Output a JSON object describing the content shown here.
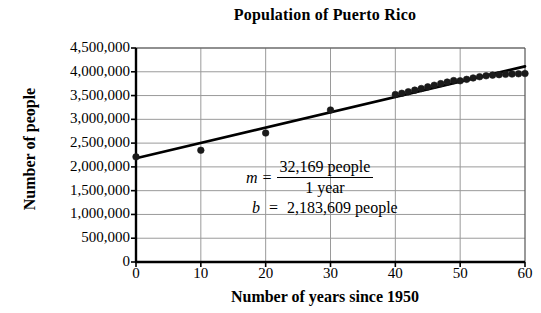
{
  "chart_data": {
    "type": "scatter",
    "title": "Population of Puerto Rico",
    "xlabel": "Number of years since 1950",
    "ylabel": "Number of people",
    "xlim": [
      0,
      60
    ],
    "ylim": [
      0,
      4500000
    ],
    "xticks": [
      0,
      10,
      20,
      30,
      40,
      50,
      60
    ],
    "xtick_labels": [
      "0",
      "10",
      "20",
      "30",
      "40",
      "50",
      "60"
    ],
    "yticks": [
      0,
      500000,
      1000000,
      1500000,
      2000000,
      2500000,
      3000000,
      3500000,
      4000000,
      4500000
    ],
    "ytick_labels": [
      "0",
      "500,000",
      "1,000,000",
      "1,500,000",
      "2,000,000",
      "2,500,000",
      "3,000,000",
      "3,500,000",
      "4,000,000",
      "4,500,000"
    ],
    "grid": true,
    "grid_color": "#9a9a9a",
    "legend": null,
    "marker_color": "#1a1a1a",
    "line_color": "#000000",
    "series": [
      {
        "name": "Population data points",
        "kind": "scatter",
        "x": [
          0,
          10,
          20,
          30,
          40,
          41,
          42,
          43,
          44,
          45,
          46,
          47,
          48,
          49,
          50,
          51,
          52,
          53,
          54,
          55,
          56,
          57,
          58,
          59,
          60
        ],
        "y": [
          2210703,
          2349544,
          2712033,
          3196520,
          3522037,
          3547968,
          3580258,
          3613710,
          3647805,
          3682512,
          3717252,
          3750650,
          3783152,
          3814428,
          3810605,
          3840360,
          3870085,
          3895885,
          3915798,
          3929552,
          3938909,
          3946779,
          3952149,
          3957988,
          3962756
        ]
      },
      {
        "name": "Line of best fit",
        "kind": "line",
        "x": [
          0,
          60
        ],
        "y": [
          2183609,
          4113749
        ]
      }
    ],
    "annotations": [
      {
        "id": "slope",
        "variable": "m",
        "equals": "=",
        "numerator": "32,169 people",
        "denominator": "1 year",
        "form": "fraction"
      },
      {
        "id": "intercept",
        "variable": "b",
        "equals": "=",
        "value": "2,183,609 people",
        "form": "inline"
      }
    ]
  },
  "plot_geometry": {
    "left": 136,
    "right": 525,
    "top": 48,
    "bottom": 262
  }
}
